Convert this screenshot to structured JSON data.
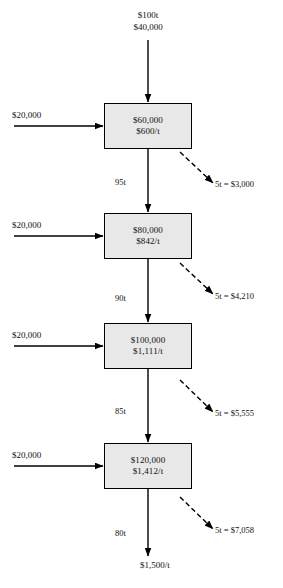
{
  "diagram": {
    "type": "process-flow",
    "input": {
      "tonnage": "$100t",
      "cost": "$40,000"
    },
    "stages": [
      {
        "id": "stage-1",
        "total_cost": "$60,000",
        "unit_cost": "$600/t",
        "added_cost": "$20,000",
        "output_tonnage": "95t",
        "loss": "5t = $3,000"
      },
      {
        "id": "stage-2",
        "total_cost": "$80,000",
        "unit_cost": "$842/t",
        "added_cost": "$20,000",
        "output_tonnage": "90t",
        "loss": "5t = $4,210"
      },
      {
        "id": "stage-3",
        "total_cost": "$100,000",
        "unit_cost": "$1,111/t",
        "added_cost": "$20,000",
        "output_tonnage": "85t",
        "loss": "5t = $5,555"
      },
      {
        "id": "stage-4",
        "total_cost": "$120,000",
        "unit_cost": "$1,412/t",
        "added_cost": "$20,000",
        "output_tonnage": "80t",
        "loss": "5t = $7,058"
      }
    ],
    "output": {
      "unit_cost": "$1,500/t"
    },
    "colors": {
      "box_fill": "#e8e8e8",
      "stroke": "#000000",
      "text": "#111111",
      "background": "#ffffff"
    }
  }
}
